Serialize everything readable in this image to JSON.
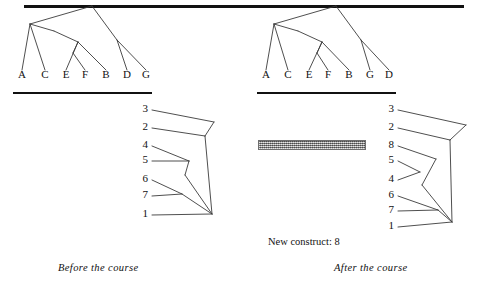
{
  "figure": {
    "top_rule": true
  },
  "before_panel": {
    "caption": "Before the course",
    "tree": {
      "leaves": [
        "A",
        "C",
        "E",
        "F",
        "B",
        "D",
        "G"
      ],
      "leaf_x": [
        22,
        45,
        66,
        85,
        106,
        127,
        146
      ],
      "leaf_label_y": 76,
      "baseline_y": 92,
      "baseline_x1": 13,
      "baseline_x2": 152,
      "edges": [
        [
          22,
          70,
          30,
          24
        ],
        [
          30,
          24,
          92,
          6
        ],
        [
          45,
          70,
          30,
          24
        ],
        [
          30,
          24,
          54,
          31
        ],
        [
          54,
          31,
          78,
          42
        ],
        [
          66,
          70,
          78,
          42
        ],
        [
          85,
          70,
          73,
          53
        ],
        [
          73,
          53,
          78,
          42
        ],
        [
          106,
          70,
          78,
          42
        ],
        [
          92,
          6,
          117,
          40
        ],
        [
          127,
          70,
          117,
          40
        ],
        [
          146,
          70,
          117,
          40
        ]
      ]
    },
    "grid": {
      "labels": [
        "3",
        "2",
        "4",
        "5",
        "6",
        "7",
        "1"
      ],
      "label_x": 148,
      "label_y": [
        110,
        128,
        146,
        161,
        180,
        196,
        215
      ],
      "edges": [
        [
          152,
          110,
          214,
          122
        ],
        [
          214,
          122,
          205,
          136
        ],
        [
          152,
          128,
          205,
          136
        ],
        [
          205,
          136,
          212,
          214
        ],
        [
          152,
          146,
          189,
          161
        ],
        [
          152,
          161,
          189,
          161
        ],
        [
          189,
          161,
          185,
          175
        ],
        [
          185,
          175,
          212,
          214
        ],
        [
          152,
          180,
          182,
          194
        ],
        [
          152,
          196,
          182,
          194
        ],
        [
          182,
          194,
          212,
          214
        ],
        [
          152,
          215,
          212,
          214
        ]
      ]
    }
  },
  "after_panel": {
    "caption": "After the course",
    "new_construct_note": "New construct: 8",
    "tree": {
      "leaves": [
        "A",
        "C",
        "E",
        "F",
        "B",
        "G",
        "D"
      ],
      "leaf_x": [
        266,
        288,
        309,
        328,
        349,
        370,
        389
      ],
      "leaf_label_y": 76,
      "baseline_y": 92,
      "baseline_x1": 257,
      "baseline_x2": 396,
      "edges": [
        [
          266,
          70,
          274,
          24
        ],
        [
          274,
          24,
          336,
          6
        ],
        [
          288,
          70,
          274,
          24
        ],
        [
          274,
          24,
          298,
          31
        ],
        [
          298,
          31,
          322,
          42
        ],
        [
          309,
          70,
          322,
          42
        ],
        [
          328,
          70,
          317,
          53
        ],
        [
          317,
          53,
          322,
          42
        ],
        [
          349,
          70,
          322,
          42
        ],
        [
          336,
          6,
          361,
          40
        ],
        [
          370,
          70,
          361,
          40
        ],
        [
          389,
          70,
          361,
          40
        ]
      ]
    },
    "grid": {
      "labels": [
        "3",
        "2",
        "8",
        "5",
        "4",
        "6",
        "7",
        "1"
      ],
      "label_x": 394,
      "label_y": [
        110,
        128,
        146,
        161,
        180,
        196,
        211,
        227
      ],
      "edges": [
        [
          398,
          110,
          466,
          125
        ],
        [
          466,
          125,
          450,
          140
        ],
        [
          398,
          128,
          450,
          140
        ],
        [
          450,
          140,
          452,
          222
        ],
        [
          398,
          146,
          436,
          159
        ],
        [
          436,
          159,
          422,
          185
        ],
        [
          422,
          185,
          452,
          222
        ],
        [
          398,
          161,
          420,
          172
        ],
        [
          398,
          180,
          420,
          172
        ],
        [
          398,
          196,
          438,
          210
        ],
        [
          398,
          211,
          438,
          210
        ],
        [
          438,
          210,
          452,
          222
        ],
        [
          398,
          227,
          452,
          222
        ]
      ]
    },
    "hatch_bar": {
      "x": 258,
      "y": 140,
      "width": 108,
      "height": 10
    }
  },
  "colors": {
    "ink": "#111111",
    "line": "#3b3b3b",
    "hatch": "#8d8d8d",
    "background": "#ffffff"
  }
}
